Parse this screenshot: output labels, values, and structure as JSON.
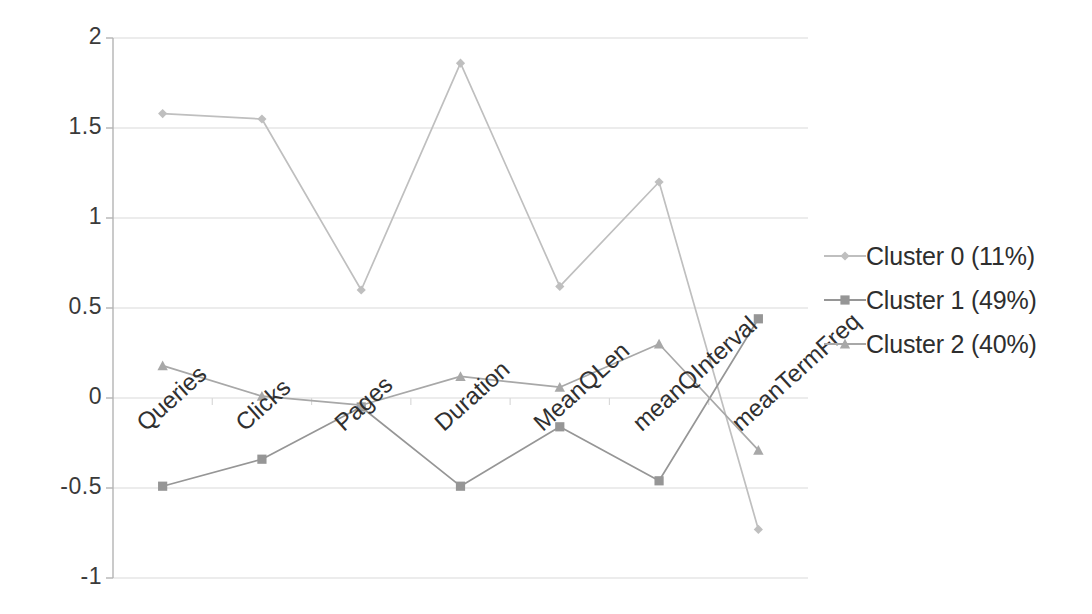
{
  "chart_data": {
    "type": "line",
    "title": "",
    "xlabel": "",
    "ylabel": "",
    "categories": [
      "Queries",
      "Clicks",
      "Pages",
      "Duration",
      "MeanQLen",
      "meanQInterval",
      "meanTermFreq"
    ],
    "ylim": [
      -1,
      2
    ],
    "yticks": [
      2,
      1.5,
      1,
      0.5,
      0,
      -0.5,
      -1
    ],
    "ytick_labels": [
      "2",
      "1.5",
      "1",
      "0.5",
      "0",
      "-0.5",
      "-1"
    ],
    "grid": true,
    "legend_position": "right",
    "series": [
      {
        "name": "Cluster 0 (11%)",
        "marker": "diamond",
        "color": "#bfbfbf",
        "values": [
          1.58,
          1.55,
          0.6,
          1.86,
          0.62,
          1.2,
          -0.73
        ]
      },
      {
        "name": "Cluster 1 (49%)",
        "marker": "square",
        "color": "#969696",
        "values": [
          -0.49,
          -0.34,
          -0.05,
          -0.49,
          -0.16,
          -0.46,
          0.44
        ]
      },
      {
        "name": "Cluster 2 (40%)",
        "marker": "triangle",
        "color": "#a8a8a8",
        "values": [
          0.18,
          0.01,
          -0.04,
          0.12,
          0.06,
          0.3,
          -0.29
        ]
      }
    ]
  },
  "axis": {
    "axis_color": "#b4b4b4",
    "grid_color": "#d9d9d9"
  },
  "legend": {
    "items": [
      {
        "label": "Cluster 0 (11%)"
      },
      {
        "label": "Cluster 1 (49%)"
      },
      {
        "label": "Cluster 2 (40%)"
      }
    ]
  }
}
